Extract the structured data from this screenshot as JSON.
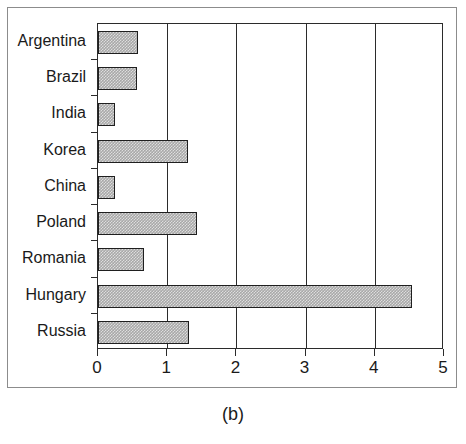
{
  "caption": "(b)",
  "chart_data": {
    "type": "bar",
    "orientation": "horizontal",
    "title": "",
    "xlabel": "",
    "ylabel": "",
    "categories": [
      "Argentina",
      "Brazil",
      "India",
      "Korea",
      "China",
      "Poland",
      "Romania",
      "Hungary",
      "Russia"
    ],
    "values": [
      0.58,
      0.57,
      0.25,
      1.3,
      0.25,
      1.43,
      0.66,
      4.54,
      1.31
    ],
    "xlim": [
      0,
      5
    ],
    "xticks": [
      0,
      1,
      2,
      3,
      4,
      5
    ],
    "xtick_labels": [
      "0",
      "1",
      "2",
      "3",
      "4",
      "5"
    ],
    "grid": true,
    "grid_axis": "x",
    "legend": null,
    "bar_fill_color": "#a8a8a8",
    "bar_edge_color": "#1f1f1f",
    "axis_color": "#2b2b2b",
    "background_color": "#ffffff"
  }
}
